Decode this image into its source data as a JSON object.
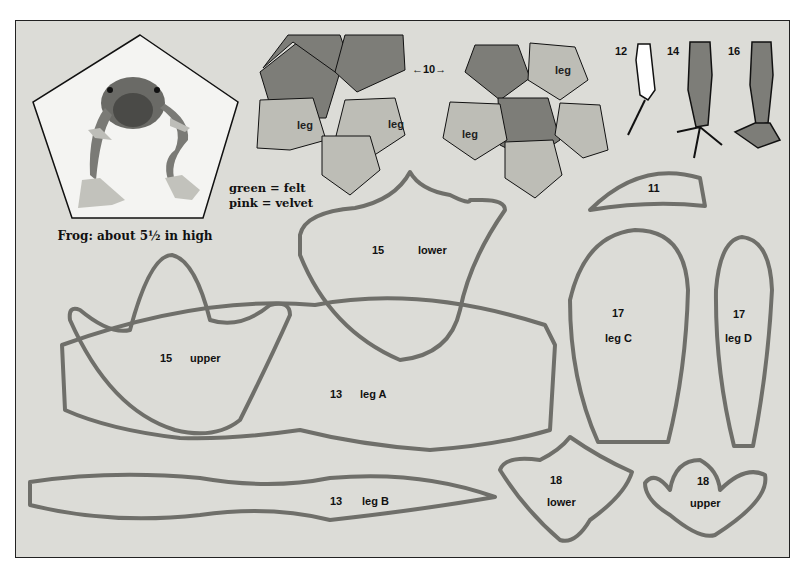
{
  "caption": "Frog: about 5½ in high",
  "legend": {
    "line1": "green = felt",
    "line2": "pink  = velvet"
  },
  "colors": {
    "paper": "#dcdcd7",
    "felt_green": "#7d7d78",
    "velvet_pink": "#bdbdb6",
    "outline": "#6f6f6a",
    "ink": "#1a1a1a"
  },
  "pieces": {
    "p10": {
      "num": "10",
      "arrow": "←10→"
    },
    "p10_leg_labels": [
      "leg",
      "leg",
      "leg",
      "leg"
    ],
    "p11": {
      "num": "11"
    },
    "p12": {
      "num": "12"
    },
    "p14": {
      "num": "14"
    },
    "p16": {
      "num": "16"
    },
    "p15_lower": {
      "num": "15",
      "name": "lower"
    },
    "p15_upper": {
      "num": "15",
      "name": "upper"
    },
    "p13_legA": {
      "num": "13",
      "name": "leg A"
    },
    "p13_legB": {
      "num": "13",
      "name": "leg B"
    },
    "p17_legC": {
      "num": "17",
      "name": "leg C"
    },
    "p17_legD": {
      "num": "17",
      "name": "leg D"
    },
    "p18_lower": {
      "num": "18",
      "name": "lower"
    },
    "p18_upper": {
      "num": "18",
      "name": "upper"
    }
  }
}
